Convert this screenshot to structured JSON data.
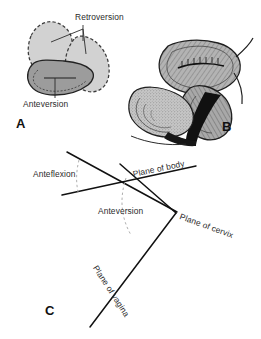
{
  "figure": {
    "background_color": "#ffffff",
    "ink_color": "#1a1a1a",
    "panels": [
      {
        "letter": "A",
        "name": "uterine-version-diagram",
        "description": "Outline drawing comparing anteversion and retroversion positions of the uterus"
      },
      {
        "letter": "B",
        "name": "midsagittal-section",
        "description": "Shaded midsagittal anatomical section of uterus, cervix, vagina and bladder"
      },
      {
        "letter": "C",
        "name": "planes-angle-diagram",
        "description": "Line diagram of the planes of body, cervix and vagina with flexion and version angles"
      }
    ]
  },
  "panel_a": {
    "letter": "A",
    "labels": {
      "retroversion": "Retroversion",
      "anteversion": "Anteversion"
    },
    "colors": {
      "retroversion_fill": "#d2d2d2",
      "retroversion_stroke": "#3b3b3b",
      "anteversion_fill": "#9c9c9c",
      "anteversion_stroke": "#2a2a2a"
    }
  },
  "panel_b": {
    "letter": "B",
    "colors": {
      "tissue_light": "#cfcfcf",
      "tissue_mid": "#8e8e8e",
      "tissue_dark": "#4a4a4a",
      "cavity_black": "#121212",
      "outline": "#1f1f1f"
    }
  },
  "panel_c": {
    "letter": "C",
    "labels": {
      "anteflexion": "Anteflexion",
      "anteversion": "Anteversion",
      "plane_of_body": "Plane of body",
      "plane_of_cervix": "Plane of cervix",
      "plane_of_vagina": "Plane of vagina"
    },
    "colors": {
      "line": "#111111",
      "dashed_arc": "#9a9a9a"
    },
    "lines": [
      {
        "name": "plane-of-body-line",
        "x1": 62,
        "y1": 195,
        "x2": 196,
        "y2": 166
      },
      {
        "name": "upper-flexion-line",
        "x1": 67,
        "y1": 152,
        "x2": 177,
        "y2": 212
      },
      {
        "name": "plane-of-cervix-line",
        "x1": 120,
        "y1": 164,
        "x2": 176,
        "y2": 213
      },
      {
        "name": "plane-of-vagina-line",
        "x1": 176,
        "y1": 213,
        "x2": 90,
        "y2": 327
      }
    ]
  }
}
